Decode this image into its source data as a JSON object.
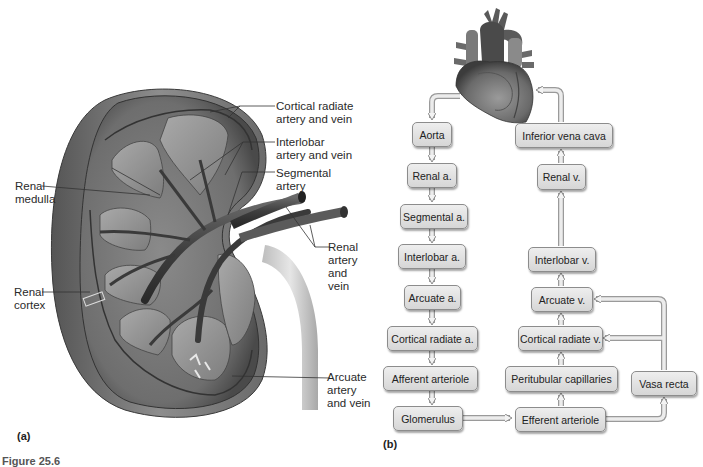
{
  "figure": {
    "panel_a": {
      "letter": "(a)",
      "labels": {
        "cortical_radiate": [
          "Cortical radiate",
          "artery and vein"
        ],
        "interlobar": [
          "Interlobar",
          "artery and vein"
        ],
        "segmental": [
          "Segmental",
          "artery"
        ],
        "renal_artery_vein": [
          "Renal",
          "artery",
          "and",
          "vein"
        ],
        "renal_medulla": [
          "Renal",
          "medulla"
        ],
        "renal_cortex": [
          "Renal",
          "cortex"
        ],
        "arcuate": [
          "Arcuate",
          "artery",
          "and vein"
        ]
      }
    },
    "panel_b": {
      "letter": "(b)",
      "boxes": {
        "aorta": "Aorta",
        "renal_a": "Renal a.",
        "segmental_a": "Segmental a.",
        "interlobar_a": "Interlobar a.",
        "arcuate_a": "Arcuate a.",
        "cortical_radiate_a": "Cortical radiate a.",
        "afferent_arteriole": "Afferent arteriole",
        "glomerulus": "Glomerulus",
        "efferent_arteriole": "Efferent arteriole",
        "peritubular_capillaries": "Peritubular capillaries",
        "vasa_recta": "Vasa recta",
        "cortical_radiate_v": "Cortical radiate v.",
        "arcuate_v": "Arcuate v.",
        "interlobar_v": "Interlobar v.",
        "renal_v": "Renal v.",
        "inferior_vena_cava": "Inferior vena cava"
      }
    },
    "caption": "Figure 25.6"
  }
}
